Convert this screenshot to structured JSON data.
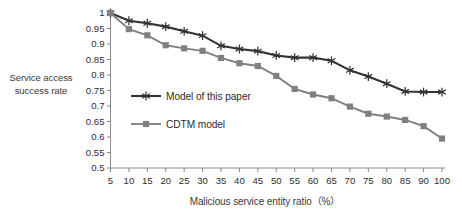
{
  "chart_data": {
    "type": "line",
    "title": "",
    "xlabel": "Malicious service entity ratio（%）",
    "ylabel_line1": "Service access",
    "ylabel_line2": "success rate",
    "x": [
      5,
      10,
      15,
      20,
      25,
      30,
      35,
      40,
      45,
      50,
      55,
      60,
      65,
      70,
      75,
      80,
      85,
      90,
      100
    ],
    "xtick_labels": [
      "5",
      "10",
      "15",
      "20",
      "25",
      "30",
      "35",
      "40",
      "45",
      "50",
      "55",
      "60",
      "65",
      "70",
      "75",
      "80",
      "85",
      "90",
      "100"
    ],
    "ytick_labels": [
      "1",
      "0.95",
      "0.9",
      "0.85",
      "0.8",
      "0.75",
      "0.7",
      "0.65",
      "0.6",
      "0.55",
      "0.5"
    ],
    "ytick_values": [
      1,
      0.95,
      0.9,
      0.85,
      0.8,
      0.75,
      0.7,
      0.65,
      0.6,
      0.55,
      0.5
    ],
    "ylim": [
      0.5,
      1.0
    ],
    "grid": false,
    "legend_position": "inside-left",
    "series": [
      {
        "name": "Model of this paper",
        "color": "#333333",
        "marker": "asterisk",
        "values": [
          1.0,
          0.975,
          0.967,
          0.956,
          0.941,
          0.927,
          0.894,
          0.884,
          0.877,
          0.863,
          0.856,
          0.856,
          0.846,
          0.815,
          0.795,
          0.772,
          0.747,
          0.745,
          0.745
        ]
      },
      {
        "name": "CDTM model",
        "color": "#808080",
        "marker": "square",
        "values": [
          1.0,
          0.948,
          0.928,
          0.896,
          0.886,
          0.878,
          0.855,
          0.838,
          0.829,
          0.797,
          0.755,
          0.737,
          0.725,
          0.698,
          0.675,
          0.666,
          0.655,
          0.635,
          0.595
        ]
      }
    ]
  },
  "legend": {
    "items": [
      {
        "label": "Model of this paper"
      },
      {
        "label": "CDTM model"
      }
    ]
  }
}
